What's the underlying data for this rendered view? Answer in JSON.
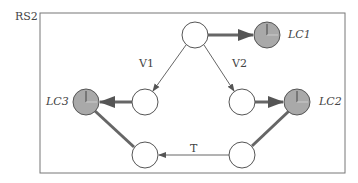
{
  "diagram": {
    "title": "RS2",
    "edge_labels": {
      "v1": "V1",
      "v2": "V2",
      "t": "T"
    },
    "nodes": [
      {
        "id": "top",
        "type": "state",
        "label": ""
      },
      {
        "id": "v1_node",
        "type": "state",
        "label": ""
      },
      {
        "id": "v2_node",
        "type": "state",
        "label": ""
      },
      {
        "id": "bottom_left",
        "type": "state",
        "label": ""
      },
      {
        "id": "bottom_right",
        "type": "state",
        "label": ""
      },
      {
        "id": "lc1",
        "type": "clock",
        "label": "LC1"
      },
      {
        "id": "lc2",
        "type": "clock",
        "label": "LC2"
      },
      {
        "id": "lc3",
        "type": "clock",
        "label": "LC3"
      }
    ],
    "edges": [
      {
        "from": "top",
        "to": "v1_node",
        "label": "V1",
        "style": "thin"
      },
      {
        "from": "top",
        "to": "v2_node",
        "label": "V2",
        "style": "thin"
      },
      {
        "from": "top",
        "to": "lc1",
        "label": "",
        "style": "thick"
      },
      {
        "from": "v1_node",
        "to": "lc3",
        "label": "",
        "style": "thick"
      },
      {
        "from": "v2_node",
        "to": "lc2",
        "label": "",
        "style": "thick"
      },
      {
        "from": "bottom_right",
        "to": "bottom_left",
        "label": "T",
        "style": "thin"
      },
      {
        "from": "bottom_left",
        "to": "lc3",
        "label": "",
        "style": "thick-line"
      },
      {
        "from": "bottom_right",
        "to": "lc2",
        "label": "",
        "style": "thick-line"
      }
    ],
    "colors": {
      "stroke": "#555555",
      "clock_fill": "#a9a9a9",
      "thick": "#666666"
    }
  }
}
